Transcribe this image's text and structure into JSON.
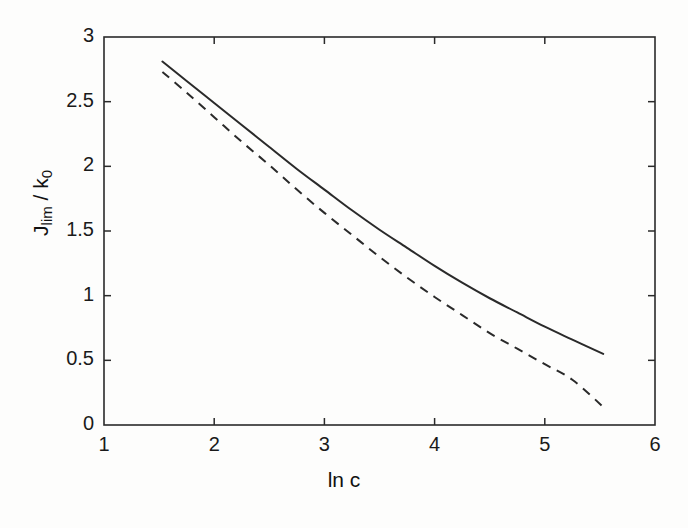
{
  "figure": {
    "background_color": "#fdfdfc",
    "ink_color": "#2a2a2a"
  },
  "axes": {
    "x_title": "ln c",
    "y_title_main": "J",
    "y_title_sub1": "lim",
    "y_title_mid": " / k",
    "y_title_sub2": "0",
    "x_ticks": [
      "1",
      "2",
      "3",
      "4",
      "5",
      "6"
    ],
    "y_ticks": [
      "0",
      "0.5",
      "1",
      "1.5",
      "2",
      "2.5",
      "3"
    ]
  },
  "chart_data": {
    "type": "line",
    "title": "",
    "xlabel": "ln c",
    "ylabel": "J_lim / k_0",
    "xlim": [
      1,
      6
    ],
    "ylim": [
      0,
      3
    ],
    "xticks": [
      1,
      2,
      3,
      4,
      5,
      6
    ],
    "yticks": [
      0,
      0.5,
      1,
      1.5,
      2,
      2.5,
      3
    ],
    "grid": false,
    "legend": "none",
    "series": [
      {
        "name": "solid-curve",
        "style": "solid",
        "color": "#2a2a2a",
        "x": [
          1.53,
          1.75,
          2.0,
          2.25,
          2.5,
          2.75,
          3.0,
          3.25,
          3.5,
          3.75,
          4.0,
          4.25,
          4.5,
          4.75,
          5.0,
          5.25,
          5.53
        ],
        "y": [
          2.81,
          2.66,
          2.49,
          2.32,
          2.15,
          1.98,
          1.82,
          1.66,
          1.51,
          1.37,
          1.23,
          1.1,
          0.98,
          0.87,
          0.76,
          0.66,
          0.55
        ]
      },
      {
        "name": "dashed-curve",
        "style": "dashed",
        "color": "#2a2a2a",
        "x": [
          1.53,
          1.75,
          2.0,
          2.25,
          2.5,
          2.75,
          3.0,
          3.25,
          3.5,
          3.75,
          4.0,
          4.25,
          4.5,
          4.75,
          5.0,
          5.25,
          5.53
        ],
        "y": [
          2.73,
          2.57,
          2.38,
          2.19,
          2.01,
          1.82,
          1.64,
          1.47,
          1.3,
          1.14,
          0.99,
          0.85,
          0.71,
          0.59,
          0.47,
          0.35,
          0.14
        ]
      }
    ]
  }
}
